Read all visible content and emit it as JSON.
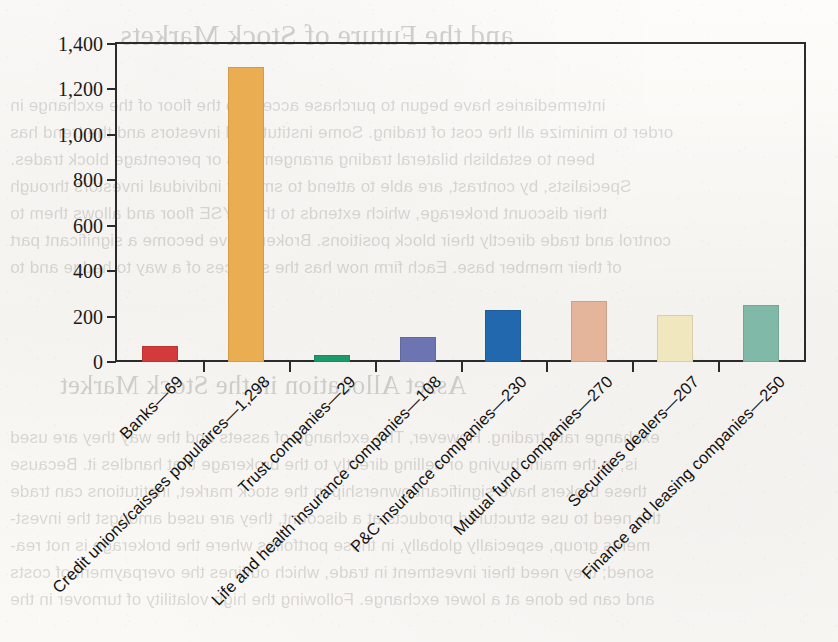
{
  "page": {
    "background_note": "scanned book page",
    "recto_text_lines": [
      "...and the Future of Stock Markets",
      "asset allocation in the Stock Market"
    ],
    "bleed_through_lines": [
      "and the Future of Stock Markets",
      "intermediaries have begun to purchase access to the floor of the exchange in",
      "order to minimize all the cost of trading. Some institutional investors and the trend has",
      "been to establish bilateral trading arrangements or percentage block trades.",
      "Specialists, by contrast, are able to attend to smaller individual investors through",
      "their discount brokerage, which extends to the NYSE floor and allows them to",
      "control and trade directly their block positions. Brokers have become a significant part",
      "of their member base. Each firm now has the services of a way to hedge and to",
      "Asset Allocation in the Stock Market",
      "exchange rate trading. However, The exchange of assets and the way they are used",
      "is, in the main, buying or selling directly to the brokerage that handles it. Because",
      "these brokers have significant ownership in the stock market, institutions can trade",
      "the need to use structured products at a discount, they are used amongst the invest-",
      "ments group, especially globally, in those portfolios where the brokerage is not rea-",
      "soned; they need their investment in trade, which outlines the overpayment of costs",
      "and can be done at a lower exchange. Following the high volatility of turnover in the"
    ]
  },
  "chart_data": {
    "type": "bar",
    "title": "",
    "xlabel": "",
    "ylabel": "",
    "ylim": [
      0,
      1400
    ],
    "ytick_values": [
      0,
      200,
      400,
      600,
      800,
      1000,
      1200,
      1400
    ],
    "ytick_labels": [
      "0",
      "200",
      "400",
      "600",
      "800",
      "1,000",
      "1,200",
      "1,400"
    ],
    "grid": false,
    "legend": "none",
    "categories": [
      "Banks",
      "Credit unions/caisses populaires",
      "Trust companies",
      "Life and health insurance companies",
      "P&C insurance companies",
      "Mutual fund companies",
      "Securities dealers",
      "Finance and leasing companies"
    ],
    "tick_labels": [
      "Banks—69",
      "Credit unions/caisses populaires—1,298",
      "Trust companies—29",
      "Life and health insurance companies—108",
      "P&C insurance companies—230",
      "Mutual fund companies—270",
      "Securities dealers—207",
      "Finance and leasing companies—250"
    ],
    "values": [
      69,
      1298,
      29,
      108,
      230,
      270,
      207,
      250
    ],
    "colors": [
      "#d43a3c",
      "#eaad51",
      "#1d9a6c",
      "#6c75b1",
      "#2268ae",
      "#e4b49b",
      "#f1e7be",
      "#81b9a9"
    ]
  }
}
